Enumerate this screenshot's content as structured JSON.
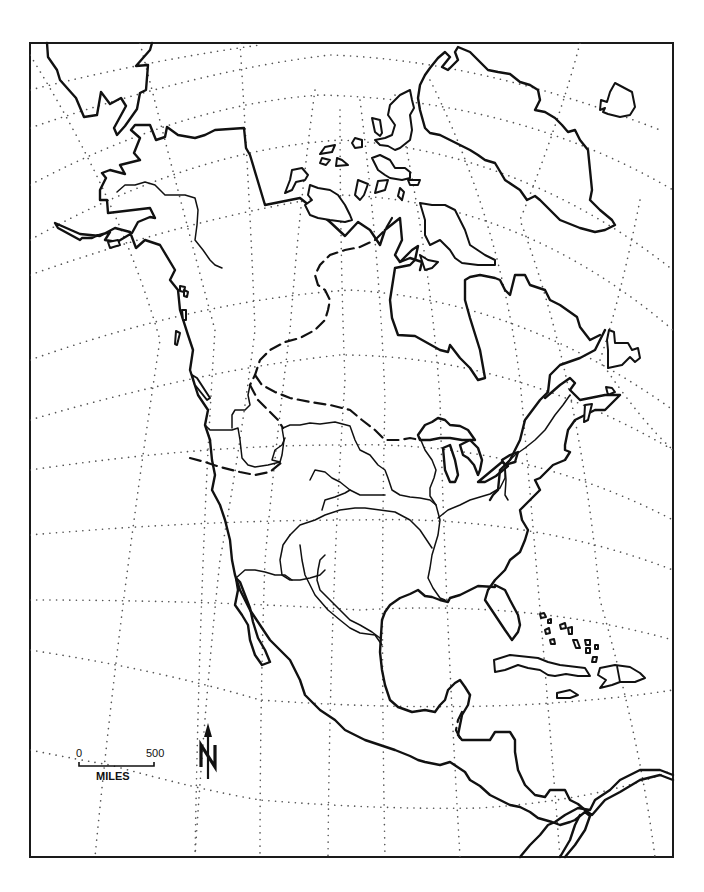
{
  "map": {
    "title": "North America outline map",
    "features": {
      "graticule": "dotted latitude/longitude lines",
      "coastlines": "North America, Greenland, Arctic archipelago, Caribbean islands",
      "rivers": [
        "Yukon",
        "Mackenzie",
        "Columbia",
        "Snake",
        "Missouri",
        "Platte",
        "Arkansas",
        "Red",
        "Mississippi",
        "Ohio",
        "Rio Grande",
        "Colorado",
        "St. Lawrence"
      ],
      "dashed_lines": [
        "Hudson Bay drainage divide",
        "Great Basin boundary",
        "Central American dashed border"
      ]
    },
    "colors": {
      "land_line": "#111111",
      "graticule": "#555555",
      "background": "#ffffff"
    }
  },
  "scale_bar": {
    "start_label": "0",
    "end_label": "500",
    "unit_label": "MILES"
  },
  "north_arrow": {
    "label": "N",
    "icon": "north-arrow-icon"
  }
}
